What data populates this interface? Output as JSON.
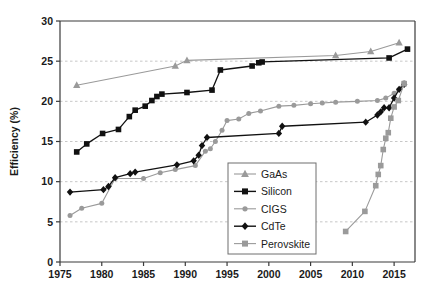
{
  "chart_data": {
    "type": "line",
    "title": "",
    "xlabel": "",
    "ylabel": "Efficiency (%)",
    "xlim": [
      1975,
      2017.5
    ],
    "ylim": [
      0,
      30
    ],
    "xticks": [
      1975,
      1980,
      1985,
      1990,
      1995,
      2000,
      2005,
      2010,
      2015
    ],
    "yticks": [
      0,
      5,
      10,
      15,
      20,
      25,
      30
    ],
    "grid": "horizontal-dashed",
    "legend_position": "center-bottom-inside",
    "series": [
      {
        "name": "GaAs",
        "color": "#9a9a9a",
        "marker": "triangle",
        "x": [
          1977.0,
          1988.8,
          1990.2,
          2008.0,
          2012.2,
          2015.6
        ],
        "y": [
          22.0,
          24.4,
          25.1,
          25.7,
          26.2,
          27.3
        ]
      },
      {
        "name": "Silicon",
        "color": "#111111",
        "marker": "square",
        "x": [
          1977.0,
          1978.2,
          1980.1,
          1982.0,
          1983.3,
          1984.0,
          1985.2,
          1986.0,
          1986.6,
          1987.2,
          1990.2,
          1993.2,
          1994.2,
          1998.0,
          1998.8,
          1999.2,
          2014.4,
          2016.6
        ],
        "y": [
          13.7,
          14.7,
          16.0,
          16.5,
          18.1,
          18.9,
          19.4,
          20.1,
          20.6,
          20.9,
          21.1,
          21.4,
          23.9,
          24.4,
          24.8,
          24.9,
          25.4,
          26.5
        ]
      },
      {
        "name": "CIGS",
        "color": "#9a9a9a",
        "marker": "circle",
        "x": [
          1976.2,
          1977.6,
          1980.0,
          1981.6,
          1985.0,
          1987.0,
          1988.8,
          1991.2,
          1992.4,
          1993.0,
          1993.6,
          1994.4,
          1995.0,
          1996.4,
          1997.6,
          1999.0,
          2001.2,
          2003.0,
          2005.0,
          2006.4,
          2008.0,
          2010.6,
          2013.0,
          2014.0,
          2015.0,
          2016.2
        ],
        "y": [
          5.8,
          6.7,
          7.3,
          10.4,
          10.4,
          11.1,
          11.5,
          12.0,
          13.8,
          14.1,
          15.0,
          16.4,
          17.6,
          17.8,
          18.5,
          18.8,
          19.4,
          19.5,
          19.7,
          19.8,
          19.9,
          20.0,
          20.1,
          20.4,
          21.0,
          22.3
        ]
      },
      {
        "name": "CdTe",
        "color": "#111111",
        "marker": "diamond",
        "x": [
          1976.2,
          1980.2,
          1980.8,
          1981.6,
          1983.4,
          1984.0,
          1989.0,
          1991.0,
          1991.6,
          1992.0,
          1992.6,
          2001.2,
          2001.6,
          2011.6,
          2013.0,
          2013.4,
          2013.8,
          2014.4,
          2015.0,
          2015.6,
          2016.2
        ],
        "y": [
          8.7,
          9.0,
          9.4,
          10.5,
          11.0,
          11.2,
          12.1,
          12.6,
          13.3,
          14.5,
          15.5,
          16.0,
          16.9,
          17.4,
          18.3,
          18.7,
          19.2,
          19.2,
          20.4,
          21.5,
          22.1
        ]
      },
      {
        "name": "Perovskite",
        "color": "#9a9a9a",
        "marker": "square",
        "x": [
          2009.2,
          2011.5,
          2012.8,
          2013.1,
          2013.4,
          2013.7,
          2014.0,
          2014.3,
          2014.6,
          2015.0,
          2015.5,
          2016.2
        ],
        "y": [
          3.8,
          6.3,
          9.5,
          10.9,
          12.0,
          14.0,
          15.4,
          16.1,
          17.9,
          19.3,
          20.1,
          22.2
        ]
      }
    ]
  },
  "legend": {
    "items": [
      {
        "label": "GaAs"
      },
      {
        "label": "Silicon"
      },
      {
        "label": "CIGS"
      },
      {
        "label": "CdTe"
      },
      {
        "label": "Perovskite"
      }
    ]
  }
}
